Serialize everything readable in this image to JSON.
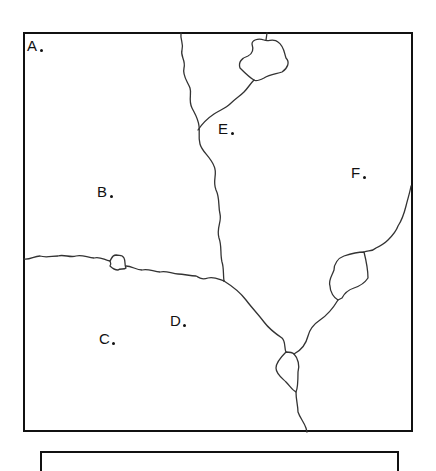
{
  "map": {
    "points": [
      {
        "id": "A",
        "label": "A",
        "x": 27,
        "y": 40
      },
      {
        "id": "B",
        "label": "B",
        "x": 97,
        "y": 186
      },
      {
        "id": "C",
        "label": "C",
        "x": 99,
        "y": 331
      },
      {
        "id": "D",
        "label": "D",
        "x": 170,
        "y": 313
      },
      {
        "id": "E",
        "label": "E",
        "x": 218,
        "y": 122
      },
      {
        "id": "F",
        "label": "F",
        "x": 351,
        "y": 166
      }
    ]
  },
  "colors": {
    "line": "#333333",
    "frame": "#111111",
    "background": "#ffffff"
  }
}
